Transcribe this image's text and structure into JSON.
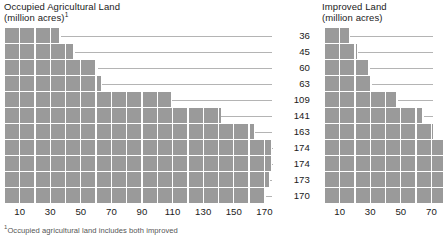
{
  "left": {
    "title": "Occupied Agricultural Land\n(million acres)",
    "title_footnote_marker": "1",
    "axis_ticks": [
      10,
      30,
      50,
      70,
      90,
      110,
      130,
      150,
      170
    ]
  },
  "right": {
    "title": "Improved Land\n(million acres)",
    "axis_ticks": [
      10,
      30,
      50,
      70
    ]
  },
  "footnote": {
    "marker": "1",
    "text": "Occupied agricultural land includes both improved"
  },
  "colors": {
    "block": "#9a9a9a",
    "leader": "#b4b4b4",
    "text": "#1a1a1a",
    "background": "#ffffff"
  },
  "chart_data": [
    {
      "type": "bar",
      "title": "Occupied Agricultural Land (million acres)",
      "orientation": "horizontal",
      "xlabel": "",
      "ylabel": "",
      "xlim": [
        0,
        180
      ],
      "grid": false,
      "block_unit": 10,
      "note": "Pictogram-style horizontal bars; each block represents 10 million acres. Value labels shown at right of each bar with leader lines.",
      "categories": [
        "r1",
        "r2",
        "r3",
        "r4",
        "r5",
        "r6",
        "r7",
        "r8",
        "r9",
        "r10",
        "r11"
      ],
      "values": [
        36,
        45,
        60,
        63,
        109,
        141,
        163,
        174,
        174,
        173,
        170
      ],
      "value_labels": [
        "36",
        "45",
        "60",
        "63",
        "109",
        "141",
        "163",
        "174",
        "174",
        "173",
        "170"
      ],
      "tick_labels": [
        "10",
        "30",
        "50",
        "70",
        "90",
        "110",
        "130",
        "150",
        "170"
      ],
      "tick_values": [
        10,
        30,
        50,
        70,
        90,
        110,
        130,
        150,
        170
      ]
    },
    {
      "type": "bar",
      "title": "Improved Land (million acres)",
      "orientation": "horizontal",
      "xlabel": "",
      "ylabel": "",
      "xlim": [
        0,
        80
      ],
      "grid": false,
      "block_unit": 10,
      "note": "Pictogram-style horizontal bars; each block represents 10 million acres. Longer lower bars extend past the cropped right edge of the panel.",
      "categories": [
        "r1",
        "r2",
        "r3",
        "r4",
        "r5",
        "r6",
        "r7",
        "r8",
        "r9",
        "r10",
        "r11"
      ],
      "values": [
        16,
        21,
        29,
        30,
        47,
        64,
        71,
        78,
        78,
        78,
        78
      ],
      "tick_labels": [
        "10",
        "30",
        "50",
        "70"
      ],
      "tick_values": [
        10,
        30,
        50,
        70
      ]
    }
  ]
}
